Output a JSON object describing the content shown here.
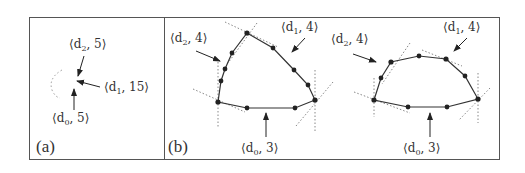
{
  "figure": {
    "panels": [
      {
        "id": "a",
        "label": "(a)",
        "annotations": [
          {
            "name": "d2",
            "base": "⟨d",
            "sub": "2",
            "value": ", 5⟩"
          },
          {
            "name": "d1",
            "base": "⟨d",
            "sub": "1",
            "value": ", 15⟩"
          },
          {
            "name": "d0",
            "base": "⟨d",
            "sub": "0",
            "value": ", 5⟩"
          }
        ]
      },
      {
        "id": "b",
        "label": "(b)",
        "shapes": [
          {
            "annotations": [
              {
                "name": "d2",
                "base": "⟨d",
                "sub": "2",
                "value": ", 4⟩"
              },
              {
                "name": "d1",
                "base": "⟨d",
                "sub": "1",
                "value": ", 4⟩"
              },
              {
                "name": "d0",
                "base": "⟨d",
                "sub": "0",
                "value": ", 3⟩"
              }
            ]
          },
          {
            "annotations": [
              {
                "name": "d2",
                "base": "⟨d",
                "sub": "2",
                "value": ", 4⟩"
              },
              {
                "name": "d1",
                "base": "⟨d",
                "sub": "1",
                "value": ", 4⟩"
              },
              {
                "name": "d0",
                "base": "⟨d",
                "sub": "0",
                "value": ", 3⟩"
              }
            ]
          }
        ]
      }
    ],
    "colors": {
      "line": "#333333",
      "frame": "#555555",
      "dotted": "#888888"
    }
  }
}
